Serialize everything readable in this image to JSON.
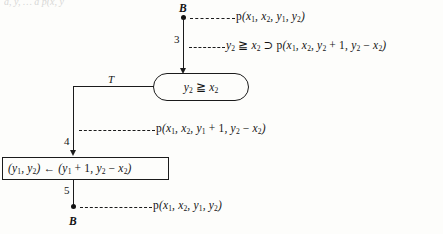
{
  "figure": {
    "type": "flowchart-verification-diagram",
    "top_cropped_text": "a, y, … a p(x, y",
    "nodes": [
      {
        "id": "node-b-top",
        "label": "B",
        "shape": "cut-point-dot"
      },
      {
        "id": "decision-test",
        "label": "y₂ ≧ x₂",
        "shape": "oval"
      },
      {
        "id": "assignment",
        "label": "(y₁, y₂) ← (y₁ + 1, y₂ − x₂)",
        "shape": "rectangle"
      },
      {
        "id": "node-b-bottom",
        "label": "B",
        "shape": "cut-point-dot"
      }
    ],
    "edge_numbers": {
      "edge_3": "3",
      "edge_4": "4",
      "edge_5": "5"
    },
    "branch_labels": {
      "true_branch": "T"
    },
    "assertions": {
      "assertion_b_top": "p(x₁, x₂, y₁, y₂)",
      "assertion_edge_3": "y₂ ≧ x₂ ⊃ p(x₁, x₂, y₂ + 1, y₂ − x₂)",
      "assertion_edge_4": "p(x₁, x₂, y₁ + 1, y₂ − x₂)",
      "assertion_b_bottom": "p(x₁, x₂, y₁, y₂)"
    },
    "colors": {
      "ink": "#1b1b1b",
      "paper": "#fdfdfb"
    }
  }
}
